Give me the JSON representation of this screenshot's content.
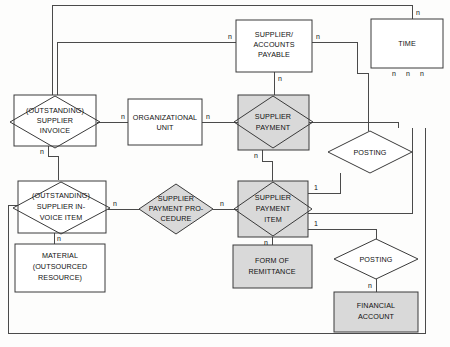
{
  "diagram": {
    "type": "entity-relationship-diagram",
    "notation": "SAP SERM / min-max style, cardinality labels n and 1",
    "colors": {
      "shaded_fill": "#d9d9d9",
      "plain_fill": "#ffffff",
      "line": "#4a4a4a",
      "text": "#111111",
      "background": "#fdfdfc"
    },
    "nodes": [
      {
        "id": "outstanding-supplier-invoice",
        "shape": "diamond-in-box",
        "shaded": false,
        "lines": [
          "(OUTSTANDING)",
          "SUPPLIER",
          "INVOICE"
        ]
      },
      {
        "id": "organizational-unit",
        "shape": "box",
        "shaded": false,
        "lines": [
          "ORGANIZATIONAL",
          "UNIT"
        ]
      },
      {
        "id": "supplier-accounts-payable",
        "shape": "box",
        "shaded": false,
        "lines": [
          "SUPPLIER/",
          "ACCOUNTS",
          "PAYABLE"
        ]
      },
      {
        "id": "time",
        "shape": "box",
        "shaded": false,
        "lines": [
          "TIME"
        ]
      },
      {
        "id": "supplier-payment",
        "shape": "diamond-in-box",
        "shaded": true,
        "lines": [
          "SUPPLIER",
          "PAYMENT"
        ]
      },
      {
        "id": "posting-upper",
        "shape": "diamond",
        "shaded": false,
        "lines": [
          "POSTING"
        ]
      },
      {
        "id": "outstanding-supplier-invoice-item",
        "shape": "diamond-in-box",
        "shaded": false,
        "lines": [
          "(OUTSTANDING)",
          "SUPPLIER IN-",
          "VOICE ITEM"
        ]
      },
      {
        "id": "supplier-payment-procedure",
        "shape": "diamond",
        "shaded": true,
        "lines": [
          "SUPPLIER",
          "PAYMENT PRO-",
          "CEDURE"
        ]
      },
      {
        "id": "supplier-payment-item",
        "shape": "diamond-in-box",
        "shaded": true,
        "lines": [
          "SUPPLIER",
          "PAYMENT",
          "ITEM"
        ]
      },
      {
        "id": "material-outsourced-resource",
        "shape": "box",
        "shaded": false,
        "lines": [
          "MATERIAL",
          "(OUTSOURCED",
          "RESOURCE)"
        ]
      },
      {
        "id": "form-of-remittance",
        "shape": "box",
        "shaded": true,
        "lines": [
          "FORM OF",
          "REMITTANCE"
        ]
      },
      {
        "id": "posting-lower",
        "shape": "diamond",
        "shaded": false,
        "lines": [
          "POSTING"
        ]
      },
      {
        "id": "financial-account",
        "shape": "box",
        "shaded": true,
        "lines": [
          "FINANCIAL",
          "ACCOUNT"
        ]
      }
    ],
    "cardinalities": [
      {
        "id": "card-ou-left",
        "text": "n"
      },
      {
        "id": "card-ou-right",
        "text": "n"
      },
      {
        "id": "card-sap-left",
        "text": "n"
      },
      {
        "id": "card-sap-right",
        "text": "n"
      },
      {
        "id": "card-sap-bottom",
        "text": "n"
      },
      {
        "id": "card-time-top",
        "text": "n"
      },
      {
        "id": "card-time-bottom-1",
        "text": "n"
      },
      {
        "id": "card-time-bottom-2",
        "text": "n"
      },
      {
        "id": "card-time-bottom-3",
        "text": "n"
      },
      {
        "id": "card-osi-bottom",
        "text": "n"
      },
      {
        "id": "card-sp-bottom",
        "text": "n"
      },
      {
        "id": "card-osii-right",
        "text": "n"
      },
      {
        "id": "card-osii-bottom",
        "text": "n"
      },
      {
        "id": "card-spp-right",
        "text": "n"
      },
      {
        "id": "card-spi-right-top",
        "text": "1"
      },
      {
        "id": "card-spi-right-bottom",
        "text": "1"
      },
      {
        "id": "card-spi-bottom",
        "text": "n"
      },
      {
        "id": "card-posting-lower-bottom",
        "text": "n"
      }
    ]
  }
}
